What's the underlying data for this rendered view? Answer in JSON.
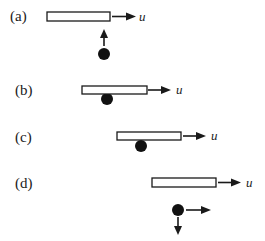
{
  "figure": {
    "panels": [
      {
        "label": "(a)",
        "velocity_label": "u",
        "ball_velocity": [
          "up"
        ],
        "ball_contact": "below, approaching"
      },
      {
        "label": "(b)",
        "velocity_label": "u",
        "ball_velocity": [],
        "ball_contact": "touching underside"
      },
      {
        "label": "(c)",
        "velocity_label": "u",
        "ball_velocity": [],
        "ball_contact": "touching underside"
      },
      {
        "label": "(d)",
        "velocity_label": "u",
        "ball_velocity": [
          "right",
          "down"
        ],
        "ball_contact": "below, separated"
      }
    ]
  }
}
